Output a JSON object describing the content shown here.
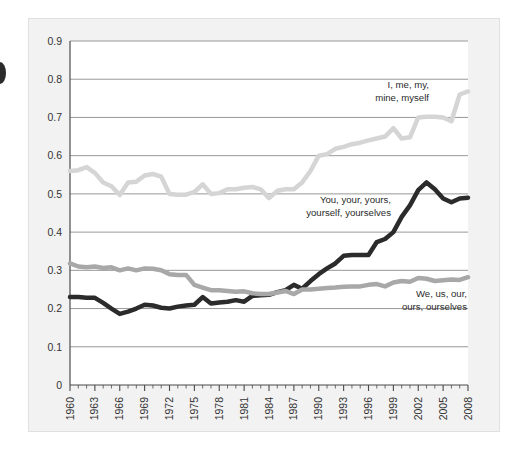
{
  "chart_data": {
    "type": "line",
    "title": "",
    "subtitle": "",
    "xlabel": "",
    "ylabel": "",
    "xlim": [
      1960,
      2008
    ],
    "ylim": [
      0,
      0.9
    ],
    "grid": true,
    "grid_axis": "y",
    "legend_position": "inline-annotations",
    "x_tick_labels": [
      "1960",
      "1963",
      "1966",
      "1969",
      "1972",
      "1975",
      "1978",
      "1981",
      "1984",
      "1987",
      "1990",
      "1993",
      "1996",
      "1999",
      "2002",
      "2005",
      "2008"
    ],
    "x_tick_values": [
      1960,
      1963,
      1966,
      1969,
      1972,
      1975,
      1978,
      1981,
      1984,
      1987,
      1990,
      1993,
      1996,
      1999,
      2002,
      2005,
      2008
    ],
    "x_minor_tick_step": 1,
    "y_tick_labels": [
      "0",
      "0.1",
      "0.2",
      "0.3",
      "0.4",
      "0.5",
      "0.6",
      "0.7",
      "0.8",
      "0.9"
    ],
    "y_tick_values": [
      0,
      0.1,
      0.2,
      0.3,
      0.4,
      0.5,
      0.6,
      0.7,
      0.8,
      0.9
    ],
    "x": [
      1960,
      1961,
      1962,
      1963,
      1964,
      1965,
      1966,
      1967,
      1968,
      1969,
      1970,
      1971,
      1972,
      1973,
      1974,
      1975,
      1976,
      1977,
      1978,
      1979,
      1980,
      1981,
      1982,
      1983,
      1984,
      1985,
      1986,
      1987,
      1988,
      1989,
      1990,
      1991,
      1992,
      1993,
      1994,
      1995,
      1996,
      1997,
      1998,
      1999,
      2000,
      2001,
      2002,
      2003,
      2004,
      2005,
      2006,
      2007,
      2008
    ],
    "series": [
      {
        "name": "I, me, my, mine, myself",
        "label": "I, me, my,\nmine, myself",
        "color": "#d5d5d5",
        "line_width": 4.5,
        "values": [
          0.56,
          0.562,
          0.57,
          0.555,
          0.53,
          0.52,
          0.497,
          0.53,
          0.532,
          0.548,
          0.552,
          0.545,
          0.5,
          0.498,
          0.498,
          0.505,
          0.525,
          0.5,
          0.502,
          0.512,
          0.512,
          0.516,
          0.518,
          0.512,
          0.489,
          0.508,
          0.512,
          0.512,
          0.53,
          0.56,
          0.6,
          0.604,
          0.618,
          0.623,
          0.63,
          0.634,
          0.64,
          0.645,
          0.65,
          0.672,
          0.645,
          0.648,
          0.7,
          0.702,
          0.702,
          0.7,
          0.69,
          0.76,
          0.768
        ]
      },
      {
        "name": "You, your, yours, yourself, yourselves",
        "label": "You, your, yours,\nyourself, yourselves",
        "color": "#2b2b2b",
        "line_width": 4.5,
        "values": [
          0.23,
          0.23,
          0.228,
          0.228,
          0.215,
          0.2,
          0.186,
          0.192,
          0.2,
          0.21,
          0.208,
          0.202,
          0.2,
          0.205,
          0.208,
          0.21,
          0.23,
          0.213,
          0.216,
          0.218,
          0.222,
          0.218,
          0.233,
          0.235,
          0.236,
          0.243,
          0.248,
          0.262,
          0.252,
          0.272,
          0.29,
          0.305,
          0.318,
          0.338,
          0.34,
          0.34,
          0.34,
          0.374,
          0.382,
          0.4,
          0.44,
          0.47,
          0.51,
          0.53,
          0.512,
          0.488,
          0.478,
          0.488,
          0.49
        ]
      },
      {
        "name": "We, us, our, ours, ourselves",
        "label": "We, us, our,\nours, ourselves",
        "color": "#a8a8a8",
        "line_width": 4.5,
        "values": [
          0.318,
          0.31,
          0.308,
          0.31,
          0.306,
          0.308,
          0.3,
          0.305,
          0.3,
          0.305,
          0.304,
          0.3,
          0.29,
          0.288,
          0.288,
          0.262,
          0.255,
          0.248,
          0.248,
          0.246,
          0.244,
          0.245,
          0.24,
          0.238,
          0.238,
          0.242,
          0.246,
          0.238,
          0.25,
          0.25,
          0.252,
          0.254,
          0.255,
          0.257,
          0.258,
          0.258,
          0.262,
          0.264,
          0.258,
          0.268,
          0.272,
          0.27,
          0.28,
          0.278,
          0.272,
          0.274,
          0.276,
          0.275,
          0.282
        ]
      }
    ],
    "annotations": [
      {
        "name": "annotation-i-me-my",
        "lines": [
          "I, me, my,",
          "mine, myself"
        ],
        "x": 429,
        "y": 88,
        "anchor": "end"
      },
      {
        "name": "annotation-you-your",
        "lines": [
          "You, your, yours,",
          "yourself, yourselves"
        ],
        "x": 391,
        "y": 203,
        "anchor": "end"
      },
      {
        "name": "annotation-we-us-our",
        "lines": [
          "We, us, our,",
          "ours, ourselves"
        ],
        "x": 467,
        "y": 297,
        "anchor": "end"
      }
    ],
    "colors": {
      "axis": "#4a4a4a",
      "grid": "#8c8c8c",
      "plot_background": "#ffffff",
      "panel_background": "#f2f2f2",
      "text": "#333333"
    },
    "plot_area": {
      "left": 70,
      "top": 41,
      "right": 468,
      "bottom": 385
    }
  }
}
